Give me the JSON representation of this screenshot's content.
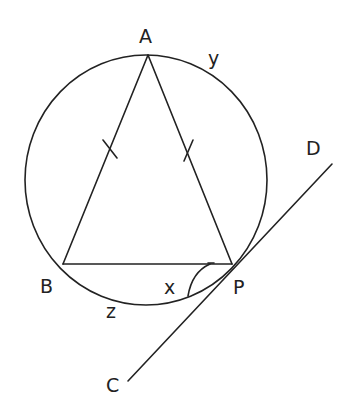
{
  "diagram": {
    "title": "",
    "shapes": {
      "circle": "circle through A, B, P",
      "triangle": [
        "A",
        "B",
        "P"
      ],
      "tangent_line": [
        "C",
        "P",
        "D"
      ]
    },
    "equal_sides": [
      "AB",
      "AP"
    ],
    "points": {
      "A": "A",
      "B": "B",
      "P": "P",
      "C": "C",
      "D": "D"
    },
    "arc_labels": {
      "y": "y",
      "z": "z"
    },
    "angle_labels": {
      "x": "x"
    }
  }
}
